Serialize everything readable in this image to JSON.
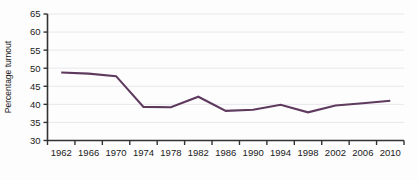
{
  "chart_data": {
    "type": "line",
    "title": "",
    "xlabel": "",
    "ylabel": "Percentage turnout",
    "x": [
      1962,
      1966,
      1970,
      1974,
      1978,
      1982,
      1986,
      1990,
      1994,
      1998,
      2002,
      2006,
      2010
    ],
    "categories": [
      "1962",
      "1966",
      "1970",
      "1974",
      "1978",
      "1982",
      "1986",
      "1990",
      "1994",
      "1998",
      "2002",
      "2006",
      "2010"
    ],
    "values": [
      48.8,
      48.5,
      47.8,
      39.3,
      39.2,
      42.1,
      38.2,
      38.5,
      39.9,
      37.8,
      39.7,
      40.3,
      41.0
    ],
    "series": [
      {
        "name": "Percentage turnout",
        "values": [
          48.8,
          48.5,
          47.8,
          39.3,
          39.2,
          42.1,
          38.2,
          38.5,
          39.9,
          37.8,
          39.7,
          40.3,
          41.0
        ],
        "color": "#5e3a5e"
      }
    ],
    "ylim": [
      30,
      65
    ],
    "yticks": [
      30,
      35,
      40,
      45,
      50,
      55,
      60,
      65
    ],
    "ytick_labels": [
      "30",
      "35",
      "40",
      "45",
      "50",
      "55",
      "60",
      "65"
    ],
    "xlim": [
      1960,
      2012
    ],
    "grid": true,
    "grid_axis": "y",
    "legend": false,
    "legend_position": "none",
    "line_color": "#5e3a5e",
    "grid_color": "#e8e8ec",
    "axis_color": "#333333",
    "background_color": "#fdfdfd"
  }
}
